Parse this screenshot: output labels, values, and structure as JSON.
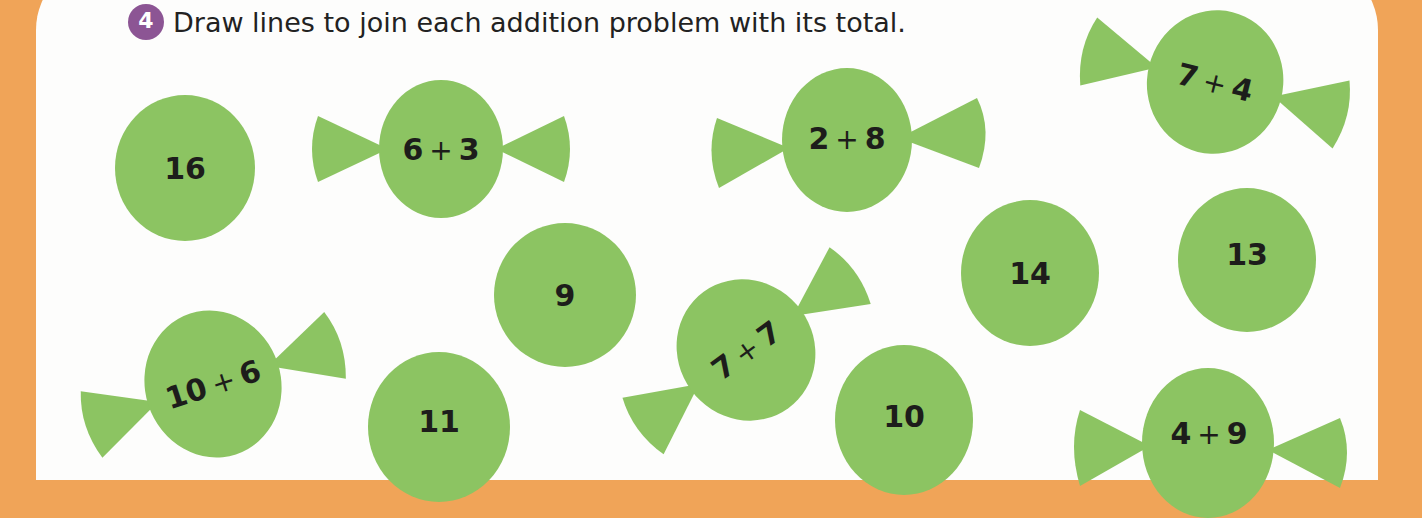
{
  "exercise": {
    "number": "4",
    "instruction": "Draw lines to join each addition problem with its total."
  },
  "colors": {
    "background_orange": "#f0a458",
    "panel": "#fdfdfc",
    "badge_purple": "#8c5594",
    "sweet_green": "#8cc462",
    "text": "#1d1d1b"
  },
  "totals": [
    {
      "value": "16"
    },
    {
      "value": "9"
    },
    {
      "value": "14"
    },
    {
      "value": "13"
    },
    {
      "value": "11"
    },
    {
      "value": "10"
    }
  ],
  "problems": [
    {
      "a": "6",
      "op": "+",
      "b": "3"
    },
    {
      "a": "2",
      "op": "+",
      "b": "8"
    },
    {
      "a": "7",
      "op": "+",
      "b": "4"
    },
    {
      "a": "10",
      "op": "+",
      "b": "6"
    },
    {
      "a": "7",
      "op": "+",
      "b": "7"
    },
    {
      "a": "4",
      "op": "+",
      "b": "9"
    }
  ]
}
